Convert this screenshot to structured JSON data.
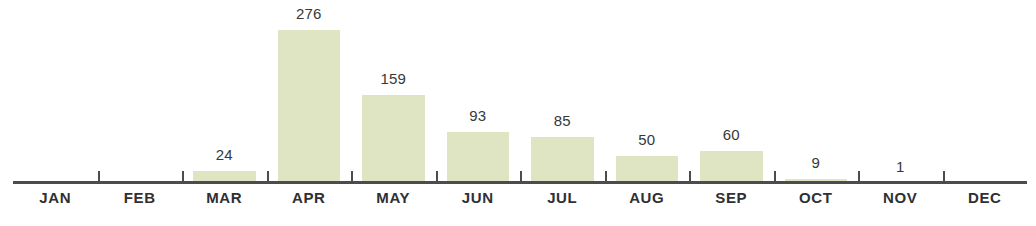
{
  "chart_data": {
    "type": "bar",
    "title": "",
    "subtitle": "",
    "xlabel": "",
    "ylabel": "",
    "categories": [
      "JAN",
      "FEB",
      "MAR",
      "APR",
      "MAY",
      "JUN",
      "JUL",
      "AUG",
      "SEP",
      "OCT",
      "NOV",
      "DEC"
    ],
    "values": [
      0,
      0,
      24,
      276,
      159,
      93,
      85,
      50,
      60,
      9,
      1,
      0
    ],
    "value_labels": [
      "",
      "",
      "24",
      "276",
      "159",
      "93",
      "85",
      "50",
      "60",
      "9",
      "1",
      ""
    ],
    "ylim": [
      0,
      276
    ],
    "grid": false,
    "legend": null,
    "annotations": [],
    "series": [
      {
        "name": "Monthly total",
        "values": [
          0,
          0,
          24,
          276,
          159,
          93,
          85,
          50,
          60,
          9,
          1,
          0
        ]
      }
    ]
  },
  "style": {
    "bar_color": "#dfe4c3",
    "axis_color": "#4b4c4e",
    "value_label_color": "#36383a",
    "category_label_color": "#2e3032",
    "background": "#ffffff"
  }
}
